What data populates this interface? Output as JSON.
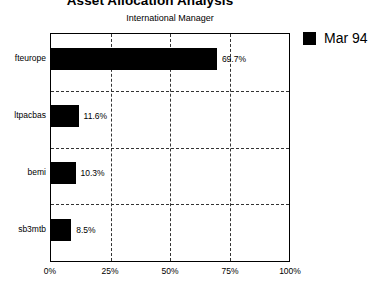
{
  "chart_data": {
    "type": "bar",
    "orientation": "horizontal",
    "title": "Asset Allocation Analysis",
    "subtitle": "International Manager",
    "categories": [
      "fteurope",
      "ltpacbas",
      "bemi",
      "sb3mtb"
    ],
    "values": [
      69.7,
      11.6,
      10.3,
      8.5
    ],
    "data_labels": [
      "69.7%",
      "11.6%",
      "10.3%",
      "8.5%"
    ],
    "series": [
      {
        "name": "Mar 94",
        "values": [
          69.7,
          11.6,
          10.3,
          8.5
        ],
        "color": "#000000"
      }
    ],
    "xlabel": "",
    "ylabel": "",
    "xlim": [
      0,
      100
    ],
    "xticks": [
      0,
      25,
      50,
      75,
      100
    ],
    "xtick_labels": [
      "0%",
      "25%",
      "50%",
      "75%",
      "100%"
    ],
    "grid": true,
    "grid_style": "dashed",
    "legend_position": "right",
    "legend_entries": [
      "Mar 94"
    ]
  },
  "legend": {
    "swatch_name": "series-color-swatch",
    "label": "Mar 94"
  },
  "colors": {
    "bar": "#000000",
    "grid": "#333333",
    "frame": "#000000",
    "background": "#ffffff"
  }
}
